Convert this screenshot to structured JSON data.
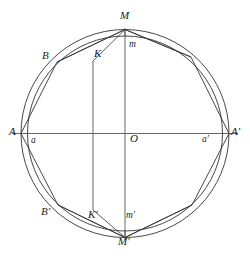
{
  "figure": {
    "background_color": "#ffffff",
    "stroke_color": "#333333",
    "axis_color": "#555555",
    "center": {
      "x": 125,
      "y": 133.5
    },
    "outer_circle": {
      "cx": 125,
      "cy": 133.5,
      "r": 104
    },
    "inner_circle": {
      "cx": 125,
      "cy": 133.5,
      "r": 97.5
    },
    "axes": {
      "horizontal": {
        "x1": 12,
        "y1": 133.5,
        "x2": 238,
        "y2": 133.5
      },
      "vertical": {
        "x1": 125,
        "y1": 28,
        "x2": 125,
        "y2": 240
      },
      "chord_left": {
        "x1": 93,
        "y1": 61,
        "x2": 93,
        "y2": 210
      }
    },
    "polygon": {
      "name": "inscribed-polygon",
      "points": "125,29.5 57,62 21,133.5 58,205 125,237.5 192,205 229,133.5 191,57"
    },
    "chords": [
      {
        "name": "chord-M-to-K",
        "x1": 125,
        "y1": 29.5,
        "x2": 93,
        "y2": 61
      },
      {
        "name": "chord-M-to-m",
        "x1": 125,
        "y1": 29.5,
        "x2": 125,
        "y2": 37
      },
      {
        "name": "chord-M-to-right",
        "x1": 125,
        "y1": 29.5,
        "x2": 191,
        "y2": 57
      },
      {
        "name": "chord-M-to-B",
        "x1": 125,
        "y1": 29.5,
        "x2": 57,
        "y2": 62
      },
      {
        "name": "chord-Mp-to-Kp",
        "x1": 125,
        "y1": 237.5,
        "x2": 93,
        "y2": 210
      },
      {
        "name": "chord-Mp-to-mp",
        "x1": 125,
        "y1": 237.5,
        "x2": 125,
        "y2": 230
      },
      {
        "name": "chord-Mp-to-right",
        "x1": 125,
        "y1": 237.5,
        "x2": 192,
        "y2": 205
      },
      {
        "name": "chord-Mp-to-Bp",
        "x1": 125,
        "y1": 237.5,
        "x2": 58,
        "y2": 205
      }
    ],
    "labels": [
      {
        "key": "M",
        "text": "M",
        "x": 120,
        "y": 10,
        "case": "cap"
      },
      {
        "key": "m",
        "text": "m",
        "x": 129,
        "y": 40,
        "case": "low"
      },
      {
        "key": "B",
        "text": "B",
        "x": 42,
        "y": 50,
        "case": "cap"
      },
      {
        "key": "K",
        "text": "K",
        "x": 94,
        "y": 48,
        "case": "cap"
      },
      {
        "key": "A",
        "text": "A",
        "x": 9,
        "y": 126,
        "case": "cap"
      },
      {
        "key": "a",
        "text": "a",
        "x": 31,
        "y": 136,
        "case": "low"
      },
      {
        "key": "O",
        "text": "O",
        "x": 130,
        "y": 133,
        "case": "cap"
      },
      {
        "key": "a_prime",
        "text": "a'",
        "x": 202,
        "y": 135,
        "case": "low"
      },
      {
        "key": "A_prime",
        "text": "A'",
        "x": 231,
        "y": 126,
        "case": "cap"
      },
      {
        "key": "B_prime",
        "text": "B'",
        "x": 41,
        "y": 206,
        "case": "cap"
      },
      {
        "key": "K_prime",
        "text": "K'",
        "x": 88,
        "y": 209,
        "case": "cap"
      },
      {
        "key": "m_prime",
        "text": "m'",
        "x": 126,
        "y": 211,
        "case": "low"
      },
      {
        "key": "M_prime",
        "text": "M'",
        "x": 118,
        "y": 236,
        "case": "cap"
      }
    ]
  }
}
